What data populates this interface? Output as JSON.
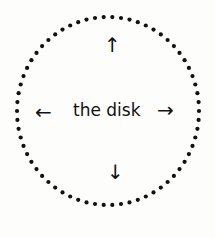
{
  "diagram": {
    "center_label": "the disk",
    "arrows": {
      "up": "↑",
      "down": "↓",
      "left": "←",
      "right": "→"
    },
    "circle": {
      "style": "dotted",
      "dot_count": 66,
      "color": "#111111"
    }
  }
}
